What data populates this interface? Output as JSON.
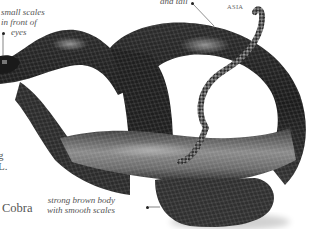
{
  "page": {
    "species_name": "Cobra",
    "region_label": "ASIA",
    "edge_text": [
      "g",
      "L."
    ]
  },
  "annotations": {
    "eyes": [
      "small scales",
      "in front of",
      "eyes"
    ],
    "tail": "and tail",
    "body": [
      "strong brown body",
      "with smooth scales"
    ]
  },
  "image": {
    "subject": "coiled snake photograph",
    "colors": {
      "dark": "#1a1a1a",
      "mid": "#555555",
      "light": "#9a9a9a",
      "background": "#ffffff"
    }
  }
}
